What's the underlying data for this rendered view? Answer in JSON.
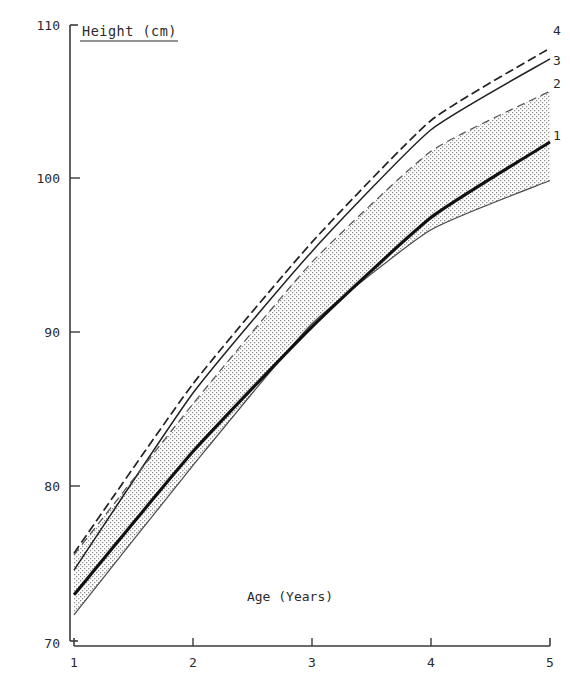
{
  "chart_data": {
    "type": "line",
    "title": "Height (cm)",
    "xlabel": "Age (Years)",
    "ylabel": "Height (cm)",
    "x": [
      1,
      2,
      3,
      4,
      5
    ],
    "xlim": [
      1,
      5
    ],
    "ylim": [
      70,
      110
    ],
    "xticks": [
      "1",
      "2",
      "3",
      "4",
      "5"
    ],
    "yticks": [
      "70",
      "80",
      "90",
      "100",
      "110"
    ],
    "grid": false,
    "legend": "inline-right-end-labels",
    "series": [
      {
        "name": "1",
        "label": "1",
        "style": "solid-thick",
        "color": "#111111",
        "values": [
          73.0,
          82.3,
          90.4,
          97.5,
          102.4
        ]
      },
      {
        "name": "2",
        "label": "2",
        "style": "dashed-thin",
        "color": "#555555",
        "values": [
          75.6,
          85.4,
          94.6,
          101.8,
          105.7
        ]
      },
      {
        "name": "3",
        "label": "3",
        "style": "solid-thin",
        "color": "#222222",
        "values": [
          74.6,
          86.1,
          95.3,
          103.2,
          107.8
        ]
      },
      {
        "name": "4",
        "label": "4",
        "style": "dashed-medium",
        "color": "#222222",
        "values": [
          75.7,
          86.7,
          95.9,
          103.8,
          108.5
        ]
      }
    ],
    "shaded_band": {
      "name": "reference-band",
      "upper_series": "2",
      "lower_values": [
        71.7,
        81.4,
        90.6,
        96.7,
        99.9
      ],
      "fill": "stipple-gray"
    },
    "annotations": []
  },
  "axes": {
    "y_axis_name": "height-axis",
    "x_axis_name": "age-axis",
    "title_underlined": true
  }
}
